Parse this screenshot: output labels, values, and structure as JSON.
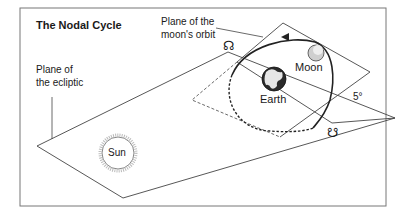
{
  "title": "The Nodal Cycle",
  "labels": {
    "moon_plane_line1": "Plane of the",
    "moon_plane_line2": "moon's orbit",
    "ecliptic_line1": "Plane of",
    "ecliptic_line2": "the ecliptic",
    "moon": "Moon",
    "earth": "Earth",
    "sun": "Sun",
    "angle": "5°",
    "ascending_node_symbol": "☊",
    "descending_node_symbol": "☋"
  },
  "colors": {
    "line": "#444444",
    "frame": "#777777",
    "text": "#1a1a1a",
    "earth_dark": "#2b2b2b",
    "moon_fill": "#cfcfcf"
  }
}
